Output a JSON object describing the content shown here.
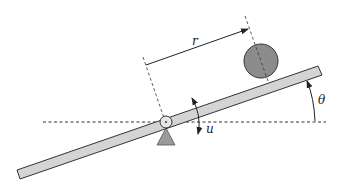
{
  "diagram": {
    "labels": {
      "r": "r",
      "u": "u",
      "theta": "θ"
    },
    "colors": {
      "beam_fill": "#d4d4d4",
      "beam_stroke": "#333333",
      "ball_fill": "#8c8c8c",
      "support_fill": "#9a9a9a",
      "line": "#222222",
      "background": "#ffffff"
    },
    "elements": [
      {
        "name": "beam",
        "type": "tilted-bar"
      },
      {
        "name": "ball",
        "type": "circle"
      },
      {
        "name": "pivot",
        "type": "circle-joint"
      },
      {
        "name": "support",
        "type": "triangle"
      },
      {
        "name": "horizontal-reference",
        "type": "dashed-line"
      },
      {
        "name": "distance-r",
        "type": "dimension-arrow"
      },
      {
        "name": "input-torque-u",
        "type": "curved-double-arrow"
      },
      {
        "name": "angle-theta",
        "type": "arc-arrow"
      }
    ]
  }
}
